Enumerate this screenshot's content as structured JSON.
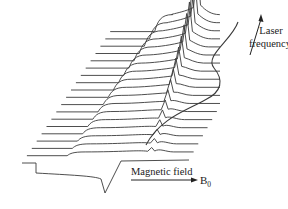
{
  "figure": {
    "type": "waterfall-spectra",
    "line_color": "#3a3a3a",
    "background": "#ffffff"
  },
  "labels": {
    "y_axis_line1": "Laser",
    "y_axis_line2": "frequency",
    "x_axis": "Magnetic field",
    "x_axis_symbol": "B",
    "x_axis_subscript": "0"
  },
  "traces": {
    "count": 19,
    "base_x_start": 22,
    "base_x_end": 130,
    "base_y": 163,
    "dx_per_trace": 4.9,
    "dy_per_trace": -7.3,
    "peak_x_offset": 127,
    "step_x_start": 62,
    "envelope_right_end": 226
  },
  "bottom_trace": {
    "dip_x": 105,
    "dip_depth": 30,
    "step_down_x": 36
  }
}
